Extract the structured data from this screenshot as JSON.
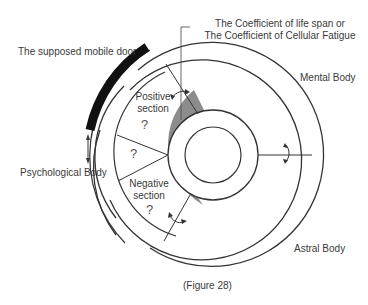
{
  "diagram": {
    "labels": {
      "mobile_door": "The supposed mobile door",
      "coefficient_line1": "The Coefficient of life span or",
      "coefficient_line2": "The Coefficient of Cellular Fatigue",
      "mental_body": "Mental Body",
      "psychological_body": "Psychological Body",
      "astral_body": "Astral Body",
      "positive_line1": "Positive",
      "positive_line2": "section",
      "negative_line1": "Negative",
      "negative_line2": "section",
      "unknown_1": "?",
      "unknown_2": "?",
      "unknown_3": "?"
    },
    "caption": "(Figure 28)",
    "colors": {
      "line": "#333333",
      "door": "#111111",
      "shaded_band": "#8c8c8c"
    }
  }
}
